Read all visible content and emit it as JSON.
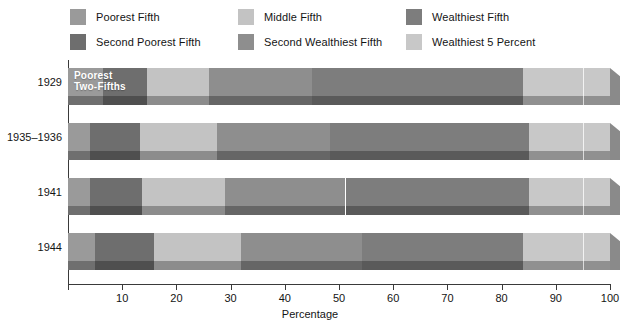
{
  "legend": {
    "items": [
      {
        "label": "Poorest Fifth",
        "color": "#9a9a9a",
        "col": 0,
        "row": 0,
        "key": "poorest_fifth"
      },
      {
        "label": "Second Poorest Fifth",
        "color": "#6e6e6e",
        "col": 0,
        "row": 1,
        "key": "second_poorest_fifth"
      },
      {
        "label": "Middle Fifth",
        "color": "#c3c3c3",
        "col": 1,
        "row": 0,
        "key": "middle_fifth"
      },
      {
        "label": "Second Wealthiest Fifth",
        "color": "#8e8e8e",
        "col": 1,
        "row": 1,
        "key": "second_wealthiest_fifth"
      },
      {
        "label": "Wealthiest Fifth",
        "color": "#7d7d7d",
        "col": 2,
        "row": 0,
        "key": "wealthiest_fifth"
      },
      {
        "label": "Wealthiest 5 Percent",
        "color": "#c8c8c8",
        "col": 2,
        "row": 1,
        "key": "wealthiest_5_percent"
      }
    ]
  },
  "axis": {
    "x_title": "Percentage",
    "x_ticks": [
      0,
      10,
      20,
      30,
      40,
      50,
      60,
      70,
      80,
      90,
      100
    ],
    "x_tick_labels": [
      "",
      "10",
      "20",
      "30",
      "40",
      "50",
      "60",
      "70",
      "80",
      "90",
      "100"
    ],
    "x_min": 0,
    "x_max": 100,
    "y_categories": [
      "1929",
      "1935–1936",
      "1941",
      "1944"
    ]
  },
  "annotations": [
    {
      "row": "1929",
      "text": "Poorest\nTwo-Fifths",
      "color": "#ffffff"
    }
  ],
  "marker_95_percent": 95,
  "chart_data": {
    "type": "bar",
    "orientation": "horizontal",
    "stacked": true,
    "title": "",
    "xlabel": "Percentage",
    "ylabel": "",
    "xlim": [
      0,
      100
    ],
    "grid": false,
    "legend_position": "top",
    "categories": [
      "1929",
      "1935–1936",
      "1941",
      "1944"
    ],
    "series": [
      {
        "name": "Poorest Fifth",
        "color": "#9a9a9a",
        "values": [
          6.5,
          4.1,
          4.1,
          4.9
        ]
      },
      {
        "name": "Second Poorest Fifth",
        "color": "#6e6e6e",
        "values": [
          8.0,
          9.2,
          9.5,
          10.9
        ]
      },
      {
        "name": "Middle Fifth",
        "color": "#c3c3c3",
        "values": [
          11.5,
          14.1,
          15.3,
          16.2
        ]
      },
      {
        "name": "Second Wealthiest Fifth",
        "color": "#8e8e8e",
        "values": [
          19.0,
          20.9,
          22.3,
          22.2
        ]
      },
      {
        "name": "Wealthiest Fifth",
        "color": "#7d7d7d",
        "values": [
          39.0,
          36.7,
          33.8,
          29.8
        ]
      },
      {
        "name": "Wealthiest 5 Percent",
        "color": "#c8c8c8",
        "values": [
          16.0,
          15.0,
          15.0,
          16.0
        ]
      }
    ]
  }
}
